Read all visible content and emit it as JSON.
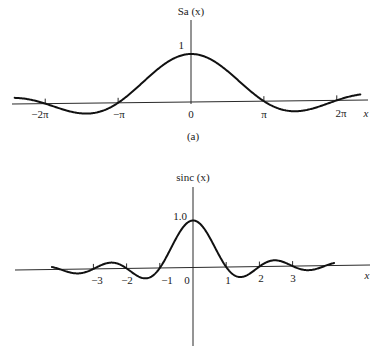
{
  "chart_data": [
    {
      "type": "line",
      "panel": "(a)",
      "title": "Sa (x)",
      "function": "sin(x)/x",
      "xlabel": "x",
      "ylabel": "Sa (x)",
      "xlim": [
        -7.2,
        7.2
      ],
      "ylim": [
        -0.3,
        1.0
      ],
      "x_ticks": [
        {
          "value": -6.2832,
          "label": "−2π"
        },
        {
          "value": -3.1416,
          "label": "−π"
        },
        {
          "value": 0,
          "label": "0"
        },
        {
          "value": 3.1416,
          "label": "π"
        },
        {
          "value": 6.2832,
          "label": "2π"
        }
      ],
      "y_ticks": [
        {
          "value": 1,
          "label": "1"
        }
      ],
      "peak": {
        "x": 0,
        "y": 1.0
      },
      "zeros": [
        -6.2832,
        -3.1416,
        3.1416,
        6.2832
      ],
      "minima": [
        {
          "x": -4.493,
          "y": -0.217
        },
        {
          "x": 4.493,
          "y": -0.217
        }
      ],
      "grid": false,
      "legend": null
    },
    {
      "type": "line",
      "panel": "(b)",
      "title": "sinc (x)",
      "function": "sin(pi x)/(pi x)",
      "xlabel": "x",
      "ylabel": "sinc (x)",
      "xlim": [
        -4.2,
        4.2
      ],
      "ylim": [
        -0.25,
        1.0
      ],
      "x_ticks": [
        {
          "value": -3,
          "label": "−3"
        },
        {
          "value": -2,
          "label": "−2"
        },
        {
          "value": -1,
          "label": "−1"
        },
        {
          "value": 0,
          "label": "0"
        },
        {
          "value": 1,
          "label": "1"
        },
        {
          "value": 2,
          "label": "2"
        },
        {
          "value": 3,
          "label": "3"
        }
      ],
      "y_ticks": [
        {
          "value": 1.0,
          "label": "1.0"
        }
      ],
      "peak": {
        "x": 0,
        "y": 1.0
      },
      "zeros": [
        -4,
        -3,
        -2,
        -1,
        1,
        2,
        3,
        4
      ],
      "grid": false,
      "legend": null
    }
  ],
  "figure": {
    "top": {
      "ylabel": "Sa (x)",
      "ytick": "1",
      "xlabel": "x",
      "caption": "(a)",
      "ticks": [
        "−2π",
        "−π",
        "0",
        "π",
        "2π"
      ]
    },
    "bottom": {
      "ylabel": "sinc (x)",
      "ytick": "1.0",
      "xlabel": "x",
      "ticks": [
        "−3",
        "−2",
        "−1",
        "0",
        "1",
        "2",
        "3"
      ]
    }
  }
}
